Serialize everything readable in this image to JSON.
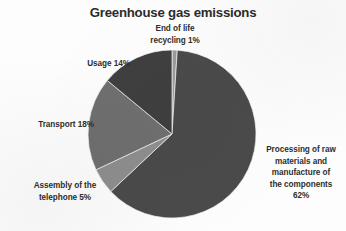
{
  "chart_data": {
    "type": "pie",
    "title": "Greenhouse gas emissions",
    "xlabel": "",
    "ylabel": "",
    "legend_position": "none",
    "grid": false,
    "units": "%",
    "categories": [
      "End of life recycling",
      "Processing of raw materials and manufacture of the components",
      "Assembly of the telephone",
      "Transport",
      "Usage"
    ],
    "values": [
      1,
      62,
      5,
      18,
      14
    ],
    "slices": [
      {
        "name": "end-of-life-recycling",
        "value": 1,
        "label_lines": [
          "End of life",
          "recycling 1%"
        ],
        "color": "#9a9a9a",
        "start_angle_deg": 0,
        "end_angle_deg": 3.6
      },
      {
        "name": "processing-raw-materials",
        "value": 62,
        "label_lines": [
          "Processing of raw",
          "materials and",
          "manufacture of",
          "the components",
          "62%"
        ],
        "color": "#4a4a4a",
        "start_angle_deg": 3.6,
        "end_angle_deg": 226.8
      },
      {
        "name": "assembly-of-telephone",
        "value": 5,
        "label_lines": [
          "Assembly of the",
          "telephone 5%"
        ],
        "color": "#8e8e8e",
        "start_angle_deg": 226.8,
        "end_angle_deg": 244.8
      },
      {
        "name": "transport",
        "value": 18,
        "label_lines": [
          "Transport 18%"
        ],
        "color": "#6f6f6f",
        "start_angle_deg": 244.8,
        "end_angle_deg": 309.6
      },
      {
        "name": "usage",
        "value": 14,
        "label_lines": [
          "Usage 14%"
        ],
        "color": "#3f3f3f",
        "start_angle_deg": 309.6,
        "end_angle_deg": 360
      }
    ],
    "geometry": {
      "center_x": 172,
      "center_y": 134,
      "radius": 84
    }
  },
  "labels": {
    "end_of_life_line1": "End of life",
    "end_of_life_line2": "recycling 1%",
    "usage": "Usage 14%",
    "transport": "Transport 18%",
    "assembly_line1": "Assembly of the",
    "assembly_line2": "telephone 5%",
    "processing_line1": "Processing of raw",
    "processing_line2": "materials and",
    "processing_line3": "manufacture of",
    "processing_line4": "the components",
    "processing_line5": "62%"
  },
  "colors": {
    "background": "#fdfdfd",
    "title_text": "#2b2b2b",
    "label_text": "#2e2e2e"
  }
}
